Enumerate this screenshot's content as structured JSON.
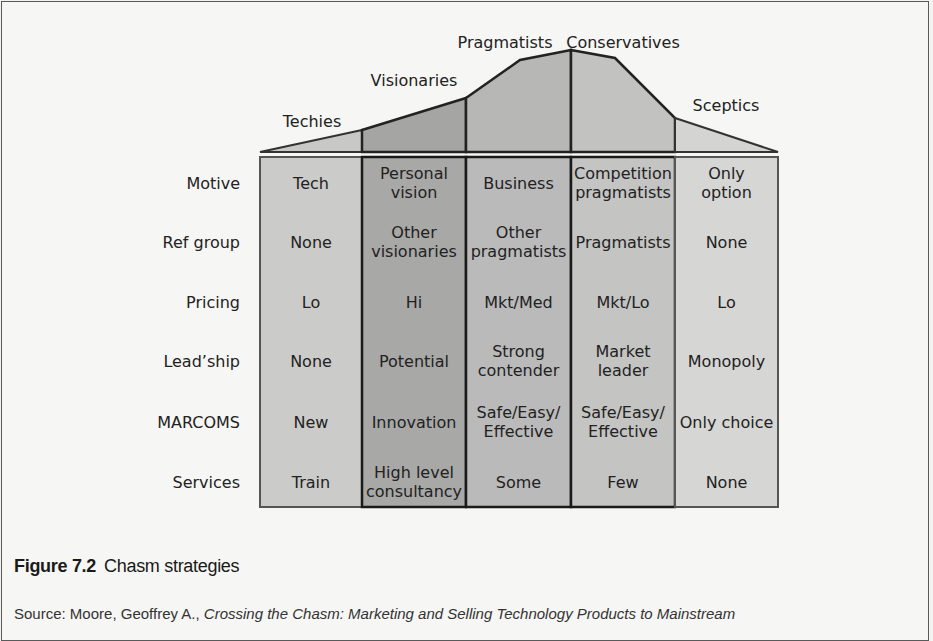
{
  "figure": {
    "number": "Figure 7.2",
    "title": "Chasm strategies",
    "source_prefix": "Source: Moore, Geoffrey A., ",
    "source_italic": "Crossing the Chasm: Marketing and Selling Technology Products to Mainstream"
  },
  "segments": [
    {
      "name": "Techies",
      "fill": "#c8c8c6"
    },
    {
      "name": "Visionaries",
      "fill": "#a5a5a3"
    },
    {
      "name": "Pragmatists",
      "fill": "#b7b7b5"
    },
    {
      "name": "Conservatives",
      "fill": "#c2c2c0"
    },
    {
      "name": "Sceptics",
      "fill": "#d4d4d2"
    }
  ],
  "row_labels": [
    "Motive",
    "Ref group",
    "Pricing",
    "Lead’ship",
    "MARCOMS",
    "Services"
  ],
  "table": [
    [
      "Tech",
      "Personal\nvision",
      "Business",
      "Competition\npragmatists",
      "Only\noption"
    ],
    [
      "None",
      "Other\nvisionaries",
      "Other\npragmatists",
      "Pragmatists",
      "None"
    ],
    [
      "Lo",
      "Hi",
      "Mkt/Med",
      "Mkt/Lo",
      "Lo"
    ],
    [
      "None",
      "Potential",
      "Strong\ncontender",
      "Market\nleader",
      "Monopoly"
    ],
    [
      "New",
      "Innovation",
      "Safe/Easy/\nEffective",
      "Safe/Easy/\nEffective",
      "Only choice"
    ],
    [
      "Train",
      "High level\nconsultancy",
      "Some",
      "Few",
      "None"
    ]
  ],
  "chart_data": {
    "type": "table",
    "title": "Chasm strategies",
    "columns": [
      "Techies",
      "Visionaries",
      "Pragmatists",
      "Conservatives",
      "Sceptics"
    ],
    "rows": [
      "Motive",
      "Ref group",
      "Pricing",
      "Lead’ship",
      "MARCOMS",
      "Services"
    ],
    "values": [
      [
        "Tech",
        "Personal vision",
        "Business",
        "Competition pragmatists",
        "Only option"
      ],
      [
        "None",
        "Other visionaries",
        "Other pragmatists",
        "Pragmatists",
        "None"
      ],
      [
        "Lo",
        "Hi",
        "Mkt/Med",
        "Mkt/Lo",
        "Lo"
      ],
      [
        "None",
        "Potential",
        "Strong contender",
        "Market leader",
        "Monopoly"
      ],
      [
        "New",
        "Innovation",
        "Safe/Easy/Effective",
        "Safe/Easy/Effective",
        "Only choice"
      ],
      [
        "Train",
        "High level consultancy",
        "Some",
        "Few",
        "None"
      ]
    ],
    "adoption_curve": "Bell-shaped technology adoption lifecycle above columns: Techies (low), Visionaries, Pragmatists (peak), Conservatives (peak), Sceptics (low)"
  }
}
